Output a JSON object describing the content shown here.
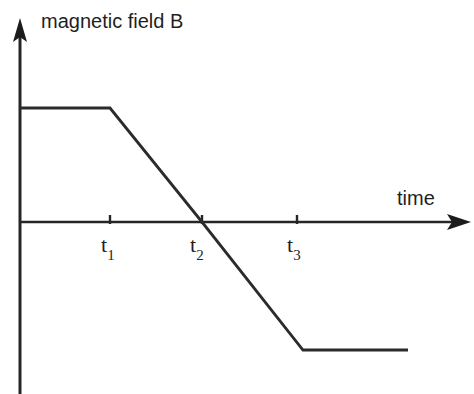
{
  "figure": {
    "background_color": "#ffffff",
    "line_color": "#262626",
    "text_color": "#1f1f1f"
  },
  "axes": {
    "y_title": "magnetic field B",
    "x_title": "time",
    "y_axis_name": "magnetic field B",
    "x_axis_name": "time",
    "origin_px": {
      "x": 20,
      "y": 222
    },
    "x_axis_end_px": 470,
    "y_axis_top_px": 20,
    "y_axis_bottom_px": 394
  },
  "ticks": [
    {
      "name": "t1",
      "label_t": "t",
      "label_sub": "1",
      "x_px": 110
    },
    {
      "name": "t2",
      "label_t": "t",
      "label_sub": "2",
      "x_px": 202
    },
    {
      "name": "t3",
      "label_t": "t",
      "label_sub": "3",
      "x_px": 297
    }
  ],
  "chart_data": {
    "type": "line",
    "title": "",
    "xlabel": "time",
    "ylabel": "magnetic field B",
    "grid": false,
    "legend": false,
    "xlim": [
      0,
      1
    ],
    "ylim": [
      -1,
      1
    ],
    "x_tick_labels": [
      "t₁",
      "t₂",
      "t₃"
    ],
    "x_tick_values": [
      0.2,
      0.405,
      0.615
    ],
    "y_tick_labels": [],
    "annotations": [
      "Constant positive B until t₁",
      "Linear decrease from t₁, crossing zero at t₂",
      "Decrease continues past t₃, levelling off to a constant negative value"
    ],
    "series": [
      {
        "name": "B(t)",
        "x": [
          0.0,
          0.2,
          0.405,
          0.64,
          0.865
        ],
        "y": [
          0.51,
          0.51,
          0.0,
          -0.565,
          -0.565
        ],
        "points_px": [
          {
            "x": 20,
            "y": 108
          },
          {
            "x": 110,
            "y": 108
          },
          {
            "x": 202,
            "y": 222
          },
          {
            "x": 303,
            "y": 350
          },
          {
            "x": 408,
            "y": 350
          }
        ]
      }
    ]
  }
}
